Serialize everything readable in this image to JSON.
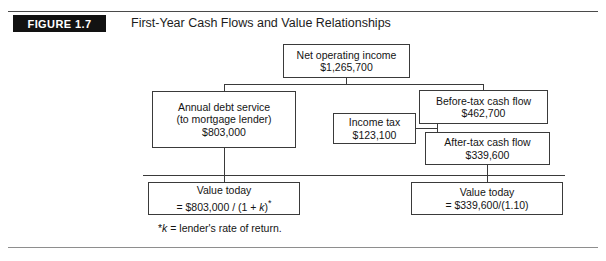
{
  "figure": {
    "badge_label": "FIGURE 1.7",
    "title": "First-Year Cash Flows and Value Relationships"
  },
  "diagram": {
    "type": "flowchart",
    "nodes": [
      {
        "id": "net-operating-income",
        "lines": [
          "Net operating income",
          "$1,265,700"
        ],
        "line1": "Net operating income",
        "line2": "$1,265,700",
        "line3": ""
      },
      {
        "id": "annual-debt-service",
        "lines": [
          "Annual debt service",
          "(to mortgage lender)",
          "$803,000"
        ],
        "line1": "Annual debt service",
        "line2": "(to mortgage lender)",
        "line3": "$803,000"
      },
      {
        "id": "before-tax-cash-flow",
        "lines": [
          "Before-tax cash flow",
          "$462,700"
        ],
        "line1": "Before-tax cash flow",
        "line2": "$462,700",
        "line3": ""
      },
      {
        "id": "income-tax",
        "lines": [
          "Income tax",
          "$123,100"
        ],
        "line1": "Income tax",
        "line2": "$123,100",
        "line3": ""
      },
      {
        "id": "after-tax-cash-flow",
        "lines": [
          "After-tax cash flow",
          "$339,600"
        ],
        "line1": "After-tax cash flow",
        "line2": "$339,600",
        "line3": ""
      },
      {
        "id": "value-today-left",
        "lines": [
          "Value today",
          "= $803,000 / (1 + k)*"
        ],
        "line1": "Value today",
        "line2_prefix": "= $803,000 / (1 + ",
        "line2_italic": "k",
        "line2_suffix": ")",
        "line2_star": "*"
      },
      {
        "id": "value-today-right",
        "lines": [
          "Value today",
          "= $339,600/(1.10)"
        ],
        "line1": "Value today",
        "line2": "= $339,600/(1.10)",
        "line3": ""
      }
    ],
    "footnote": {
      "star": "*",
      "symbol": "k",
      "text": " = lender's rate of return."
    }
  },
  "colors": {
    "rule_top": "#4a4a4a",
    "rule_bottom": "#8e8e8e",
    "badge_bg": "#121212",
    "badge_text": "#ffffff",
    "box_border": "#3a3a3a",
    "text": "#141414",
    "background": "#ffffff"
  }
}
